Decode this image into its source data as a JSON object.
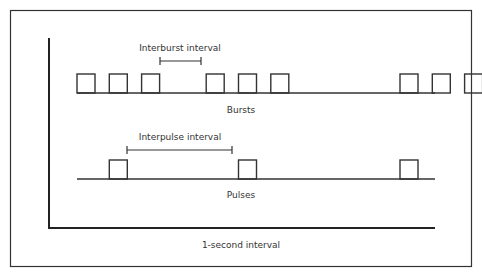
{
  "diagram": {
    "type": "timing-diagram",
    "colors": {
      "stroke": "#333333",
      "background": "#ffffff"
    },
    "bursts": {
      "label": "Bursts",
      "interval_label": "Interburst interval",
      "pulse_slots": [
        0,
        1,
        2,
        4,
        5,
        6,
        10,
        11,
        12
      ]
    },
    "pulses": {
      "label": "Pulses",
      "interval_label": "Interpulse interval",
      "pulse_slots": [
        1,
        5,
        10
      ]
    },
    "time_axis_label": "1-second interval"
  }
}
